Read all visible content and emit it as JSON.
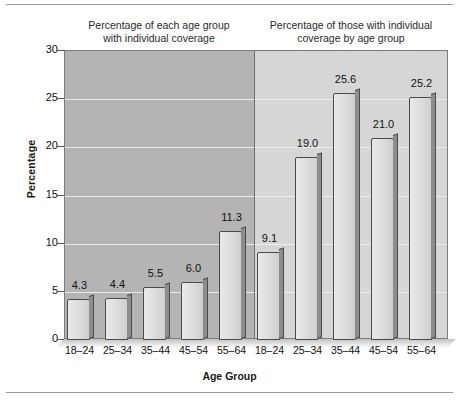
{
  "chart_data": {
    "type": "bar",
    "title": "",
    "xlabel": "Age Group",
    "ylabel": "Percentage",
    "ylim": [
      0,
      30
    ],
    "yticks": [
      0,
      5,
      10,
      15,
      20,
      25,
      30
    ],
    "grid": true,
    "legend_position": "none",
    "panels": [
      {
        "header_line1": "Percentage of each age group",
        "header_line2": "with individual coverage",
        "background_color": "#b4b4b4",
        "categories": [
          "18–24",
          "25–34",
          "35–44",
          "45–54",
          "55–64"
        ],
        "values": [
          4.3,
          4.4,
          5.5,
          6.0,
          11.3
        ],
        "value_labels": [
          "4.3",
          "4.4",
          "5.5",
          "6.0",
          "11.3"
        ]
      },
      {
        "header_line1": "Percentage of those with individual",
        "header_line2": "coverage by age group",
        "background_color": "#d6d6d6",
        "categories": [
          "18–24",
          "25–34",
          "35–44",
          "45–54",
          "55–64"
        ],
        "values": [
          9.1,
          19.0,
          25.6,
          21.0,
          25.2
        ],
        "value_labels": [
          "9.1",
          "19.0",
          "25.6",
          "21.0",
          "25.2"
        ]
      }
    ]
  }
}
